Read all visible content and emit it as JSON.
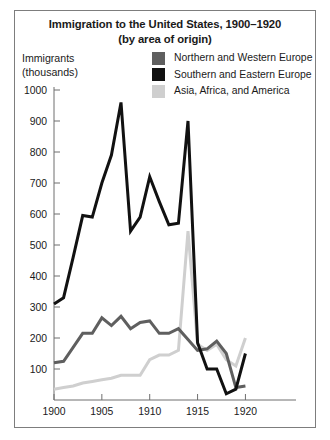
{
  "chart_data": {
    "type": "line",
    "title": "Immigration to the United States, 1900–1920",
    "subtitle": "(by area of origin)",
    "title_lines": [
      "Immigration to the United States, 1900–1920",
      "(by area of origin)"
    ],
    "ylabel_lines": [
      "Immigrants",
      "(thousands)"
    ],
    "ylabel": "Immigrants (thousands)",
    "xlabel": "",
    "xlim": [
      1900,
      1921
    ],
    "ylim": [
      0,
      1050
    ],
    "yticks": [
      100,
      200,
      300,
      400,
      500,
      600,
      700,
      800,
      900,
      1000
    ],
    "ytick_labels": [
      "100",
      "200",
      "300",
      "400",
      "500",
      "600",
      "700",
      "800",
      "900",
      "1000"
    ],
    "xticks": [
      1900,
      1905,
      1910,
      1915,
      1920
    ],
    "xtick_labels": [
      "1900",
      "1905",
      "1910",
      "1915",
      "1920"
    ],
    "grid": false,
    "legend_position": "top-right",
    "x": [
      1900,
      1901,
      1902,
      1903,
      1904,
      1905,
      1906,
      1907,
      1908,
      1909,
      1910,
      1911,
      1912,
      1913,
      1914,
      1915,
      1916,
      1917,
      1918,
      1919,
      1920
    ],
    "series": [
      {
        "name": "Northern and Western Europe",
        "color": "#5f5f5f",
        "values": [
          120,
          125,
          170,
          215,
          215,
          265,
          240,
          270,
          230,
          250,
          255,
          215,
          215,
          230,
          195,
          160,
          165,
          190,
          150,
          40,
          45
        ]
      },
      {
        "name": "Southern and Eastern Europe",
        "color": "#111111",
        "values": [
          310,
          330,
          460,
          595,
          590,
          700,
          790,
          960,
          545,
          590,
          720,
          640,
          565,
          570,
          900,
          185,
          100,
          100,
          20,
          35,
          150
        ]
      },
      {
        "name": "Asia, Africa, and America",
        "color": "#cfcfcf",
        "values": [
          35,
          40,
          45,
          55,
          60,
          65,
          70,
          80,
          80,
          80,
          130,
          145,
          145,
          160,
          545,
          180,
          160,
          180,
          130,
          110,
          200
        ]
      }
    ]
  },
  "legend": {
    "items": [
      {
        "label": "Northern and Western Europe",
        "color": "#5f5f5f"
      },
      {
        "label": "Southern and Eastern Europe",
        "color": "#111111"
      },
      {
        "label": "Asia, Africa, and America",
        "color": "#cfcfcf"
      }
    ]
  },
  "axis": {
    "y_caption_line1": "Immigrants",
    "y_caption_line2": "(thousands)"
  }
}
